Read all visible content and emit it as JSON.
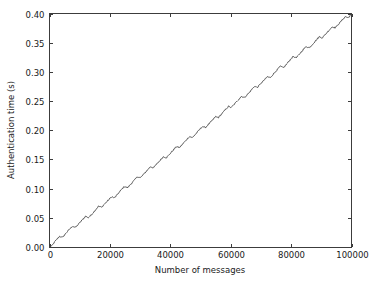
{
  "chart_data": {
    "type": "line",
    "title": "",
    "xlabel": "Number of messages",
    "ylabel": "Authentication time (s)",
    "xlim": [
      0,
      100000
    ],
    "ylim": [
      0.0,
      0.4
    ],
    "xticks": [
      0,
      20000,
      40000,
      60000,
      80000,
      100000
    ],
    "xtick_labels": [
      "0",
      "20000",
      "40000",
      "60000",
      "80000",
      "100000"
    ],
    "yticks": [
      0.0,
      0.05,
      0.1,
      0.15,
      0.2,
      0.25,
      0.3,
      0.35,
      0.4
    ],
    "ytick_labels": [
      "0.00",
      "0.05",
      "0.10",
      "0.15",
      "0.20",
      "0.25",
      "0.30",
      "0.35",
      "0.40"
    ],
    "grid": false,
    "legend": null,
    "line_color": "#4a4a4a",
    "series": [
      {
        "name": "authentication time",
        "description": "Authentication time increases approximately linearly with the number of messages, from 0.00 s at 0 messages to about 0.40 s at 100000 messages, with a small regular sawtooth ripple superimposed on the linear trend.",
        "slope_per_message": 4e-06,
        "sawtooth_period_messages": 4300,
        "sawtooth_amplitude_seconds": 0.006,
        "x": [
          0,
          2000,
          4000,
          6000,
          8000,
          10000,
          12000,
          14000,
          16000,
          18000,
          20000,
          22000,
          24000,
          26000,
          28000,
          30000,
          32000,
          34000,
          36000,
          38000,
          40000,
          42000,
          44000,
          46000,
          48000,
          50000,
          52000,
          54000,
          56000,
          58000,
          60000,
          62000,
          64000,
          66000,
          68000,
          70000,
          72000,
          74000,
          76000,
          78000,
          80000,
          82000,
          84000,
          86000,
          88000,
          90000,
          92000,
          94000,
          96000,
          98000,
          100000
        ],
        "y": [
          0.0,
          0.01,
          0.018,
          0.027,
          0.034,
          0.042,
          0.05,
          0.057,
          0.066,
          0.074,
          0.081,
          0.089,
          0.098,
          0.105,
          0.113,
          0.121,
          0.129,
          0.137,
          0.145,
          0.153,
          0.161,
          0.169,
          0.177,
          0.185,
          0.193,
          0.201,
          0.209,
          0.216,
          0.225,
          0.233,
          0.241,
          0.249,
          0.257,
          0.264,
          0.273,
          0.281,
          0.288,
          0.297,
          0.305,
          0.312,
          0.321,
          0.328,
          0.337,
          0.344,
          0.352,
          0.36,
          0.368,
          0.376,
          0.384,
          0.392,
          0.4
        ]
      }
    ]
  },
  "figure": {
    "background_color": "#ffffff",
    "axes_color": "#3c3c3c"
  }
}
